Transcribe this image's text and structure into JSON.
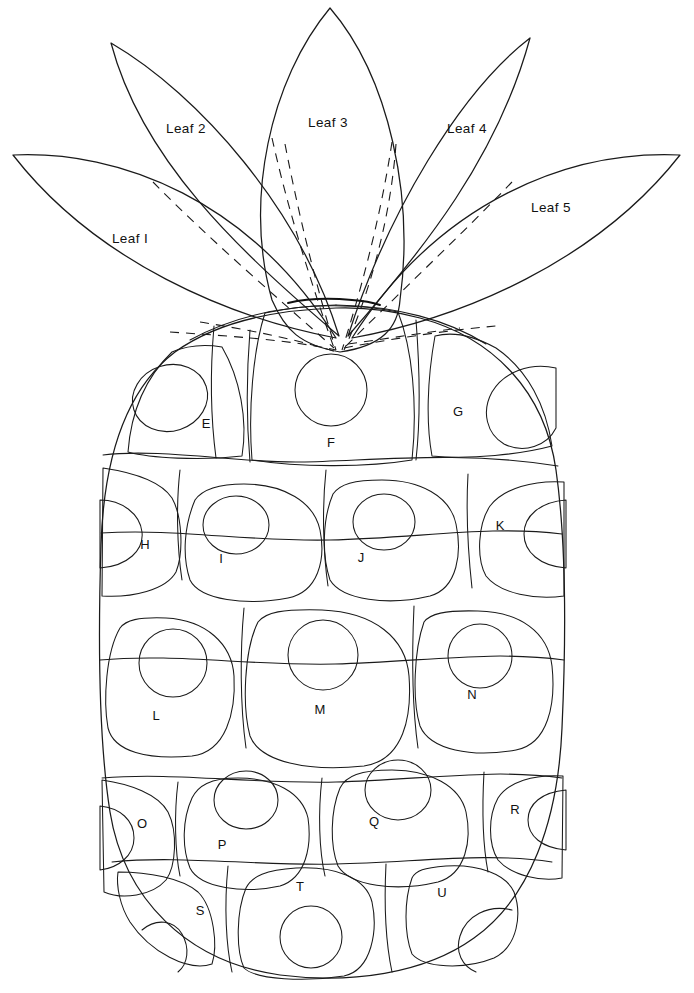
{
  "document": {
    "title": "Pineapple Applique Pattern Template",
    "type": "line-art-pattern",
    "background_color": "#ffffff",
    "line_color": "#1a1a1a",
    "width": 694,
    "height": 993
  },
  "crown": {
    "label_prefix": "Leaf",
    "leaves": [
      {
        "id": "leaf-1",
        "label": "Leaf I",
        "label_x": 130,
        "label_y": 243
      },
      {
        "id": "leaf-2",
        "label": "Leaf 2",
        "label_x": 186,
        "label_y": 133
      },
      {
        "id": "leaf-3",
        "label": "Leaf 3",
        "label_x": 328,
        "label_y": 127
      },
      {
        "id": "leaf-4",
        "label": "Leaf 4",
        "label_x": 467,
        "label_y": 133
      },
      {
        "id": "leaf-5",
        "label": "Leaf 5",
        "label_x": 551,
        "label_y": 212
      }
    ]
  },
  "body": {
    "rows": [
      {
        "row": 1,
        "cells": [
          {
            "id": "cell-e",
            "label": "E",
            "label_x": 206,
            "label_y": 428
          },
          {
            "id": "cell-f",
            "label": "F",
            "label_x": 331,
            "label_y": 447
          },
          {
            "id": "cell-g",
            "label": "G",
            "label_x": 458,
            "label_y": 416
          }
        ]
      },
      {
        "row": 2,
        "cells": [
          {
            "id": "cell-h",
            "label": "H",
            "label_x": 145,
            "label_y": 549
          },
          {
            "id": "cell-i",
            "label": "I",
            "label_x": 221,
            "label_y": 563
          },
          {
            "id": "cell-j",
            "label": "J",
            "label_x": 361,
            "label_y": 562
          },
          {
            "id": "cell-k",
            "label": "K",
            "label_x": 500,
            "label_y": 530
          }
        ]
      },
      {
        "row": 3,
        "cells": [
          {
            "id": "cell-l",
            "label": "L",
            "label_x": 156,
            "label_y": 720
          },
          {
            "id": "cell-m",
            "label": "M",
            "label_x": 320,
            "label_y": 714
          },
          {
            "id": "cell-n",
            "label": "N",
            "label_x": 472,
            "label_y": 699
          }
        ]
      },
      {
        "row": 4,
        "cells": [
          {
            "id": "cell-o",
            "label": "O",
            "label_x": 142,
            "label_y": 828
          },
          {
            "id": "cell-p",
            "label": "P",
            "label_x": 222,
            "label_y": 849
          },
          {
            "id": "cell-q",
            "label": "Q",
            "label_x": 374,
            "label_y": 826
          },
          {
            "id": "cell-r",
            "label": "R",
            "label_x": 515,
            "label_y": 814
          }
        ]
      },
      {
        "row": 5,
        "cells": [
          {
            "id": "cell-s",
            "label": "S",
            "label_x": 200,
            "label_y": 915
          },
          {
            "id": "cell-t",
            "label": "T",
            "label_x": 300,
            "label_y": 891
          },
          {
            "id": "cell-u",
            "label": "U",
            "label_x": 442,
            "label_y": 897
          }
        ]
      }
    ]
  }
}
